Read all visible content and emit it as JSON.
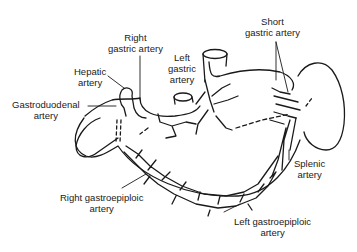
{
  "diagram": {
    "colors": {
      "line": "#1a1a1a",
      "background": "#ffffff"
    },
    "labels": [
      {
        "id": "right-gastric",
        "lines": [
          "Right",
          "gastric artery"
        ]
      },
      {
        "id": "hepatic",
        "lines": [
          "Hepatic",
          "artery"
        ]
      },
      {
        "id": "gastroduodenal",
        "lines": [
          "Gastroduodenal",
          "artery"
        ]
      },
      {
        "id": "left-gastric",
        "lines": [
          "Left",
          "gastric",
          "artery"
        ]
      },
      {
        "id": "short-gastric",
        "lines": [
          "Short",
          "gastric artery"
        ]
      },
      {
        "id": "splenic",
        "lines": [
          "Splenic",
          "artery"
        ]
      },
      {
        "id": "right-gastroepiploic",
        "lines": [
          "Right gastroepiploic",
          "artery"
        ]
      },
      {
        "id": "left-gastroepiploic",
        "lines": [
          "Left gastroepiploic",
          "artery"
        ]
      }
    ],
    "structures": [
      "stomach",
      "esophagus",
      "duodenum",
      "spleen",
      "aorta-stump"
    ]
  }
}
